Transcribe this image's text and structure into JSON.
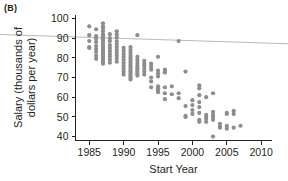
{
  "panel": {
    "label": "(B)"
  },
  "chart_data": {
    "type": "scatter",
    "title": "",
    "panel_label": "(B)",
    "xlabel": "Start Year",
    "ylabel": "Salary (thousands of dollars per year)",
    "ylabel_lines": [
      "Salary (thousands of",
      "dollars per year)"
    ],
    "xlim": [
      1983.0,
      2011.5
    ],
    "ylim": [
      38.0,
      102.0
    ],
    "xticks": [
      1985,
      1990,
      1995,
      2000,
      2005,
      2010
    ],
    "xtick_labels": [
      "1985",
      "1990",
      "1995",
      "2000",
      "2005",
      "2010"
    ],
    "yticks": [
      40,
      50,
      60,
      70,
      80,
      90,
      100
    ],
    "ytick_labels": [
      "40",
      "50",
      "60",
      "70",
      "80",
      "90",
      "100"
    ],
    "grid": false,
    "legend": null,
    "marker": {
      "shape": "circle",
      "color": "#8d8d8d",
      "radius_px": 2.1
    },
    "trend_line": {
      "label": "regression line",
      "color": "#b9b9b9",
      "x_start": 1983.0,
      "y_start": 90.6,
      "x_end": 2011.5,
      "y_end": 87.4,
      "extends_beyond_axes": true
    },
    "points": [
      [
        1985,
        96.0
      ],
      [
        1985,
        91.5
      ],
      [
        1985,
        88.5
      ],
      [
        1985,
        85.5
      ],
      [
        1985,
        85.0
      ],
      [
        1986,
        94.5
      ],
      [
        1986,
        91.0
      ],
      [
        1986,
        89.5
      ],
      [
        1986,
        88.0
      ],
      [
        1986,
        86.0
      ],
      [
        1986,
        84.5
      ],
      [
        1986,
        83.0
      ],
      [
        1986,
        81.0
      ],
      [
        1986,
        79.5
      ],
      [
        1987,
        97.5
      ],
      [
        1987,
        96.0
      ],
      [
        1987,
        95.0
      ],
      [
        1987,
        93.5
      ],
      [
        1987,
        92.0
      ],
      [
        1987,
        91.0
      ],
      [
        1987,
        90.0
      ],
      [
        1987,
        89.0
      ],
      [
        1987,
        88.0
      ],
      [
        1987,
        87.0
      ],
      [
        1987,
        86.0
      ],
      [
        1987,
        85.0
      ],
      [
        1987,
        84.0
      ],
      [
        1987,
        83.0
      ],
      [
        1987,
        82.0
      ],
      [
        1987,
        81.0
      ],
      [
        1987,
        80.0
      ],
      [
        1987,
        79.0
      ],
      [
        1987,
        78.0
      ],
      [
        1987,
        77.0
      ],
      [
        1988,
        92.0
      ],
      [
        1988,
        90.0
      ],
      [
        1988,
        88.5
      ],
      [
        1988,
        86.5
      ],
      [
        1988,
        85.0
      ],
      [
        1988,
        83.5
      ],
      [
        1988,
        82.0
      ],
      [
        1988,
        80.5
      ],
      [
        1988,
        79.0
      ],
      [
        1988,
        77.5
      ],
      [
        1989,
        93.5
      ],
      [
        1989,
        92.0
      ],
      [
        1989,
        90.5
      ],
      [
        1989,
        88.5
      ],
      [
        1989,
        87.0
      ],
      [
        1989,
        85.5
      ],
      [
        1989,
        84.0
      ],
      [
        1989,
        82.5
      ],
      [
        1989,
        81.0
      ],
      [
        1989,
        79.5
      ],
      [
        1989,
        78.0
      ],
      [
        1990,
        85.0
      ],
      [
        1990,
        83.5
      ],
      [
        1990,
        82.0
      ],
      [
        1990,
        80.5
      ],
      [
        1990,
        79.0
      ],
      [
        1990,
        77.5
      ],
      [
        1990,
        76.0
      ],
      [
        1990,
        74.5
      ],
      [
        1990,
        73.0
      ],
      [
        1990,
        71.5
      ],
      [
        1991,
        85.5
      ],
      [
        1991,
        84.0
      ],
      [
        1991,
        82.5
      ],
      [
        1991,
        81.0
      ],
      [
        1991,
        80.0
      ],
      [
        1991,
        79.0
      ],
      [
        1991,
        78.0
      ],
      [
        1991,
        77.0
      ],
      [
        1991,
        76.0
      ],
      [
        1991,
        75.0
      ],
      [
        1991,
        74.0
      ],
      [
        1991,
        73.0
      ],
      [
        1991,
        72.0
      ],
      [
        1991,
        71.0
      ],
      [
        1991,
        70.0
      ],
      [
        1991,
        69.0
      ],
      [
        1992,
        91.5
      ],
      [
        1992,
        80.5
      ],
      [
        1992,
        79.0
      ],
      [
        1992,
        77.5
      ],
      [
        1992,
        76.0
      ],
      [
        1992,
        75.0
      ],
      [
        1992,
        74.0
      ],
      [
        1992,
        73.0
      ],
      [
        1992,
        72.0
      ],
      [
        1992,
        71.0
      ],
      [
        1993,
        78.5
      ],
      [
        1993,
        77.0
      ],
      [
        1993,
        76.0
      ],
      [
        1993,
        74.5
      ],
      [
        1993,
        73.0
      ],
      [
        1993,
        71.5
      ],
      [
        1994,
        77.0
      ],
      [
        1994,
        75.5
      ],
      [
        1994,
        74.0
      ],
      [
        1994,
        70.0
      ],
      [
        1994,
        68.0
      ],
      [
        1994,
        65.0
      ],
      [
        1995,
        80.5
      ],
      [
        1995,
        73.5
      ],
      [
        1995,
        72.0
      ],
      [
        1995,
        70.5
      ],
      [
        1995,
        65.5
      ],
      [
        1995,
        64.5
      ],
      [
        1995,
        63.5
      ],
      [
        1995,
        62.5
      ],
      [
        1996,
        74.0
      ],
      [
        1996,
        73.0
      ],
      [
        1996,
        72.5
      ],
      [
        1996,
        65.0
      ],
      [
        1996,
        62.0
      ],
      [
        1996,
        59.0
      ],
      [
        1997,
        65.5
      ],
      [
        1997,
        61.5
      ],
      [
        1998,
        88.5
      ],
      [
        1998,
        62.0
      ],
      [
        1998,
        59.5
      ],
      [
        1999,
        73.0
      ],
      [
        1999,
        55.5
      ],
      [
        1999,
        50.5
      ],
      [
        1999,
        50.0
      ],
      [
        2000,
        58.5
      ],
      [
        2000,
        56.0
      ],
      [
        2000,
        53.5
      ],
      [
        2000,
        51.5
      ],
      [
        2001,
        66.0
      ],
      [
        2001,
        64.5
      ],
      [
        2001,
        61.0
      ],
      [
        2001,
        57.5
      ],
      [
        2001,
        55.0
      ],
      [
        2001,
        52.0
      ],
      [
        2001,
        48.5
      ],
      [
        2001,
        47.5
      ],
      [
        2002,
        60.0
      ],
      [
        2002,
        51.0
      ],
      [
        2002,
        50.0
      ],
      [
        2002,
        49.0
      ],
      [
        2002,
        47.5
      ],
      [
        2003,
        62.0
      ],
      [
        2003,
        52.5
      ],
      [
        2003,
        51.0
      ],
      [
        2003,
        50.0
      ],
      [
        2003,
        48.5
      ],
      [
        2003,
        40.0
      ],
      [
        2004,
        46.5
      ],
      [
        2004,
        45.0
      ],
      [
        2004,
        44.5
      ],
      [
        2005,
        52.0
      ],
      [
        2005,
        51.5
      ],
      [
        2005,
        45.5
      ],
      [
        2005,
        44.0
      ],
      [
        2006,
        53.0
      ],
      [
        2006,
        51.5
      ],
      [
        2006,
        44.5
      ],
      [
        2007,
        45.5
      ]
    ]
  }
}
